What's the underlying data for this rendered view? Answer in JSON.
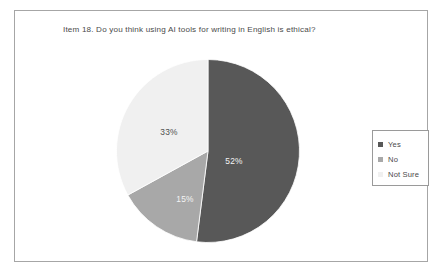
{
  "chart_data": {
    "type": "pie",
    "title": "Item 18. Do you think using AI tools for writing in English is ethical?",
    "categories": [
      "Yes",
      "No",
      "Not Sure"
    ],
    "values": [
      52,
      15,
      33
    ],
    "value_labels": [
      "52%",
      "15%",
      "33%"
    ],
    "unit": "percent",
    "legend_position": "right",
    "start_angle_deg": 0,
    "direction": "clockwise",
    "colors": {
      "yes": "#585858",
      "no": "#a8a8a8",
      "not_sure": "#f0f0f0",
      "slice_outline": "#ffffff",
      "frame_border": "#a6a6a6",
      "legend_border": "#9a9a9a",
      "title_text": "#4a4a4a",
      "label_on_dark": "#f4f4f4",
      "label_on_light": "#4f4f4f",
      "background": "#ffffff"
    },
    "xlabel": "",
    "ylabel": ""
  },
  "legend": {
    "items": [
      {
        "label": "Yes",
        "swatch_color": "#585858",
        "swatch_name": "legend-swatch-yes"
      },
      {
        "label": "No",
        "swatch_color": "#a8a8a8",
        "swatch_name": "legend-swatch-no"
      },
      {
        "label": "Not Sure",
        "swatch_color": "#f0f0f0",
        "swatch_name": "legend-swatch-not-sure"
      }
    ]
  },
  "slices": [
    {
      "name": "yes",
      "label": "52%",
      "value": 52,
      "color": "#585858",
      "label_x": 118,
      "label_y": 105,
      "label_class": "slice-label-light"
    },
    {
      "name": "no",
      "label": "15%",
      "value": 15,
      "color": "#a8a8a8",
      "label_x": 69,
      "label_y": 143,
      "label_class": "slice-label-light"
    },
    {
      "name": "not-sure",
      "label": "33%",
      "value": 33,
      "color": "#f0f0f0",
      "label_x": 53,
      "label_y": 76,
      "label_class": "slice-label-dark"
    }
  ]
}
